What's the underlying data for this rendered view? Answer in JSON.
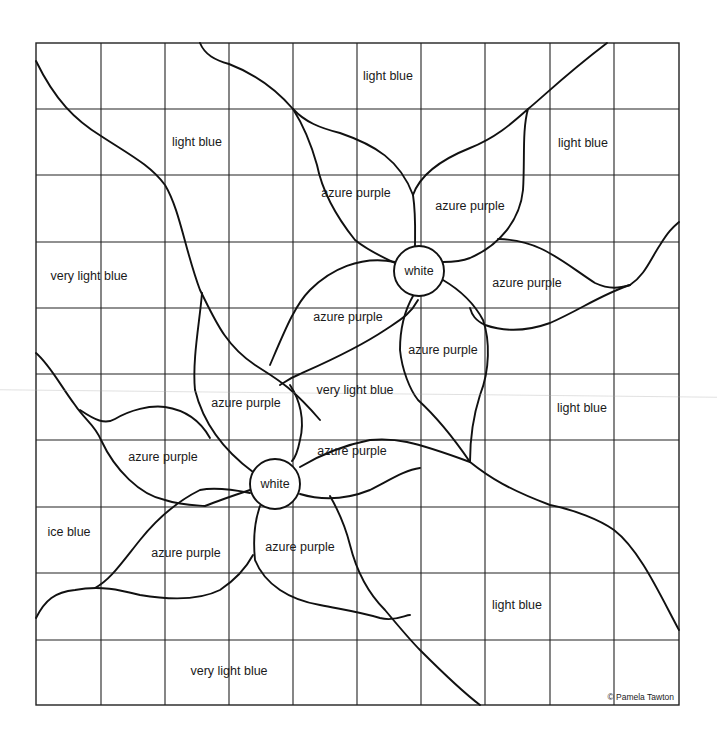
{
  "page": {
    "credit": "© Pamela Tawton"
  },
  "grid": {
    "columns": 10,
    "rows": 10,
    "left": 36,
    "top": 43,
    "right": 679,
    "bottom": 705
  },
  "centers": [
    {
      "label": "white",
      "cx": 419,
      "cy": 271,
      "r": 25
    },
    {
      "label": "white",
      "cx": 275,
      "cy": 484,
      "r": 25
    }
  ],
  "regions": [
    {
      "label": "light blue",
      "x": 388,
      "y": 76
    },
    {
      "label": "light blue",
      "x": 197,
      "y": 142
    },
    {
      "label": "light blue",
      "x": 583,
      "y": 143
    },
    {
      "label": "azure purple",
      "x": 356,
      "y": 193
    },
    {
      "label": "azure purple",
      "x": 470,
      "y": 206
    },
    {
      "label": "very light blue",
      "x": 89,
      "y": 276
    },
    {
      "label": "azure purple",
      "x": 527,
      "y": 283
    },
    {
      "label": "azure purple",
      "x": 348,
      "y": 317
    },
    {
      "label": "azure purple",
      "x": 443,
      "y": 350
    },
    {
      "label": "very light blue",
      "x": 355,
      "y": 390
    },
    {
      "label": "azure purple",
      "x": 246,
      "y": 403
    },
    {
      "label": "light blue",
      "x": 582,
      "y": 408
    },
    {
      "label": "azure purple",
      "x": 352,
      "y": 451
    },
    {
      "label": "azure purple",
      "x": 163,
      "y": 457
    },
    {
      "label": "ice blue",
      "x": 69,
      "y": 532
    },
    {
      "label": "azure purple",
      "x": 186,
      "y": 553
    },
    {
      "label": "azure purple",
      "x": 300,
      "y": 547
    },
    {
      "label": "light blue",
      "x": 517,
      "y": 605
    },
    {
      "label": "very light blue",
      "x": 229,
      "y": 671
    }
  ],
  "palette": {
    "line": "#111111",
    "grid": "#222222",
    "background": "#ffffff"
  }
}
